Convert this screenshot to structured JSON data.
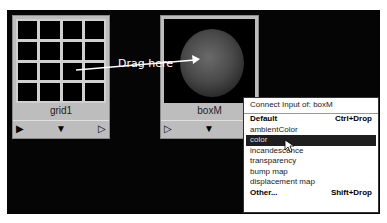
{
  "canvas": {
    "background": "#050505"
  },
  "nodes": [
    {
      "name": "grid1",
      "type": "grid-texture",
      "ports": {
        "left": "▶",
        "center": "▼",
        "right": "▷"
      }
    },
    {
      "name": "boxM",
      "type": "material-swatch",
      "ports": {
        "left": "▷",
        "center": "▼"
      }
    }
  ],
  "annotation": {
    "label": "Drag here"
  },
  "menu": {
    "title": "Connect Input of: boxM",
    "items": [
      {
        "label": "Default",
        "shortcut": "Ctrl+Drop",
        "bold": true
      },
      {
        "label": "ambientColor"
      },
      {
        "label": "color",
        "selected": true
      },
      {
        "label": "incandescence"
      },
      {
        "label": "transparency"
      },
      {
        "label": "bump map"
      },
      {
        "label": "displacement map"
      },
      {
        "label": "Other...",
        "shortcut": "Shift+Drop",
        "bold": true
      }
    ]
  }
}
